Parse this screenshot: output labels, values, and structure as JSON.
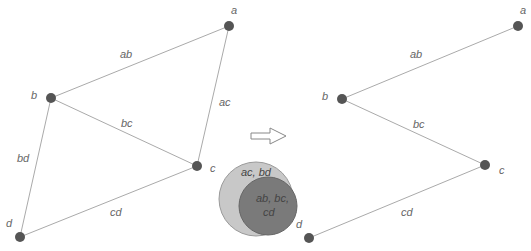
{
  "colors": {
    "node": "#555555",
    "edge": "#aaaaaa",
    "label": "#666666",
    "outer_circle": "#c8c8c8",
    "inner_circle": "#7a7a7a"
  },
  "left_graph": {
    "nodes": [
      {
        "id": "a",
        "label": "a",
        "x": 229,
        "y": 26
      },
      {
        "id": "b",
        "label": "b",
        "x": 51,
        "y": 98
      },
      {
        "id": "c",
        "label": "c",
        "x": 197,
        "y": 166
      },
      {
        "id": "d",
        "label": "d",
        "x": 20,
        "y": 237
      }
    ],
    "edges": [
      {
        "from": "a",
        "to": "b",
        "label": "ab"
      },
      {
        "from": "a",
        "to": "c",
        "label": "ac"
      },
      {
        "from": "b",
        "to": "c",
        "label": "bc"
      },
      {
        "from": "b",
        "to": "d",
        "label": "bd"
      },
      {
        "from": "c",
        "to": "d",
        "label": "cd"
      }
    ]
  },
  "right_graph": {
    "nodes": [
      {
        "id": "a",
        "label": "a",
        "x": 518,
        "y": 26
      },
      {
        "id": "b",
        "label": "b",
        "x": 342,
        "y": 99
      },
      {
        "id": "c",
        "label": "c",
        "x": 485,
        "y": 165
      },
      {
        "id": "d",
        "label": "d",
        "x": 309,
        "y": 238
      }
    ],
    "edges": [
      {
        "from": "a",
        "to": "b",
        "label": "ab"
      },
      {
        "from": "b",
        "to": "c",
        "label": "bc"
      },
      {
        "from": "c",
        "to": "d",
        "label": "cd"
      }
    ]
  },
  "venn": {
    "outer_label": "ac, bd",
    "inner_label_line1": "ab, bc,",
    "inner_label_line2": "cd"
  },
  "arrow": {
    "icon": "right-arrow-icon"
  }
}
